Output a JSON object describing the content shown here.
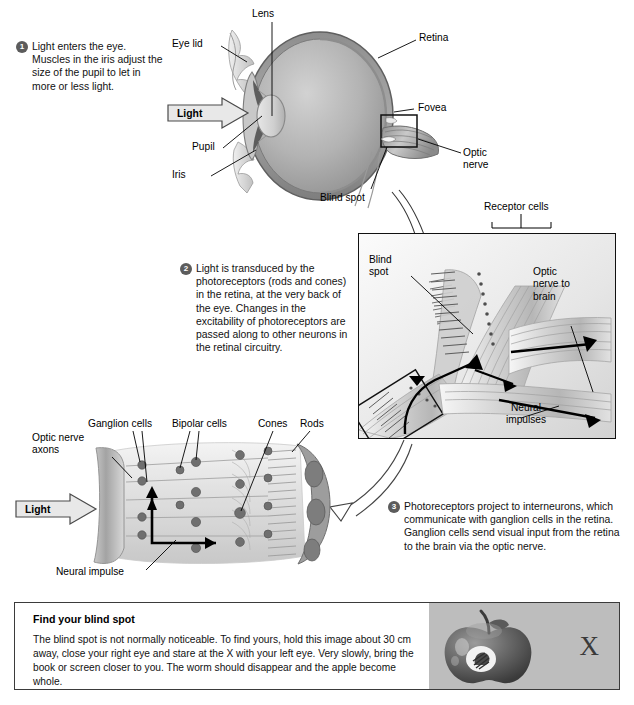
{
  "figure": {
    "background": "#ffffff"
  },
  "colors": {
    "badge": "#5c5c5c",
    "panel_border": "#111111",
    "gray_panel": "#bdbdbd",
    "sclera": "#9a9a9a",
    "vitreous": "#b5b5b5",
    "line": "#000000"
  },
  "steps": [
    {
      "number": "1",
      "text": "Light enters the eye. Muscles in the iris adjust the size of the pupil to let in more or less light."
    },
    {
      "number": "2",
      "text": "Light is transduced by the photoreceptors (rods and cones) in the retina, at the very back of the eye. Changes in the excitability of photoreceptors are passed along to other neurons in the retinal circuitry."
    },
    {
      "number": "3",
      "text": "Photoreceptors project to interneurons, which communicate with ganglion cells in the retina. Ganglion cells send visual input from the retina to the brain via the optic nerve."
    }
  ],
  "eye_diagram": {
    "labels": {
      "lens": "Lens",
      "eye_lid": "Eye lid",
      "pupil": "Pupil",
      "iris": "Iris",
      "retina": "Retina",
      "fovea": "Fovea",
      "optic_nerve": "Optic\nnerve",
      "optic_nerve_line1": "Optic",
      "optic_nerve_line2": "nerve",
      "blind_spot": "Blind spot",
      "light_arrow": "Light"
    }
  },
  "retina_panel": {
    "labels": {
      "receptor_cells": "Receptor cells",
      "blind_spot_line1": "Blind",
      "blind_spot_line2": "spot",
      "optic_nerve_line1": "Optic",
      "optic_nerve_line2": "nerve to",
      "optic_nerve_line3": "brain",
      "neural_impulses_line1": "Neural",
      "neural_impulses_line2": "impulses"
    }
  },
  "cell_diagram": {
    "labels": {
      "optic_nerve_axons_line1": "Optic nerve",
      "optic_nerve_axons_line2": "axons",
      "ganglion_cells": "Ganglion cells",
      "bipolar_cells": "Bipolar cells",
      "cones": "Cones",
      "rods": "Rods",
      "neural_impulse": "Neural impulse",
      "light_arrow": "Light"
    }
  },
  "blind_spot_box": {
    "title": "Find your blind spot",
    "body": "The blind spot is not normally noticeable. To find yours, hold this image about 30 cm away, close your right eye and stare at the X with your left eye. Very slowly, bring the book or screen closer to you. The worm should disappear and the apple become whole.",
    "fixation_mark": "X",
    "apple_icon": "apple-with-worm-icon"
  }
}
